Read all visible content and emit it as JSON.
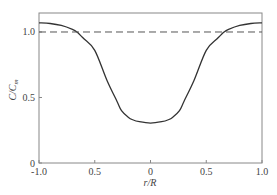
{
  "chart_data": {
    "type": "line",
    "title": "",
    "xlabel": "r/R",
    "ylabel": "C/C_m",
    "ylabel_main": "C/C",
    "ylabel_sub": "m",
    "xlim": [
      -1.0,
      1.0
    ],
    "ylim": [
      0,
      1.145
    ],
    "grid": false,
    "legend": null,
    "x_ticks": [
      -1.0,
      -0.5,
      0,
      0.5,
      1.0
    ],
    "x_tick_labels": [
      "-1.0",
      "0.5",
      "0",
      "0.5",
      "1.0"
    ],
    "y_ticks": [
      0,
      0.5,
      1.0
    ],
    "y_tick_labels": [
      "0",
      "0.5",
      "1.0"
    ],
    "series": [
      {
        "name": "C/C_m profile",
        "style": "solid",
        "color": "#333333",
        "x": [
          -1.0,
          -0.9,
          -0.8,
          -0.7,
          -0.66,
          -0.6,
          -0.5,
          -0.39,
          -0.3,
          -0.26,
          -0.2,
          -0.16,
          -0.1,
          0.0,
          0.1,
          0.16,
          0.2,
          0.26,
          0.3,
          0.39,
          0.5,
          0.6,
          0.66,
          0.7,
          0.8,
          0.9,
          1.0
        ],
        "y": [
          1.07,
          1.065,
          1.05,
          1.02,
          1.0,
          0.95,
          0.86,
          0.63,
          0.47,
          0.4,
          0.35,
          0.33,
          0.315,
          0.305,
          0.315,
          0.33,
          0.35,
          0.4,
          0.47,
          0.63,
          0.86,
          0.95,
          1.0,
          1.02,
          1.05,
          1.065,
          1.07
        ]
      },
      {
        "name": "reference C/C_m = 1",
        "style": "dashed",
        "color": "#555555",
        "x": [
          -1.0,
          1.0
        ],
        "y": [
          1.0,
          1.0
        ]
      }
    ]
  }
}
